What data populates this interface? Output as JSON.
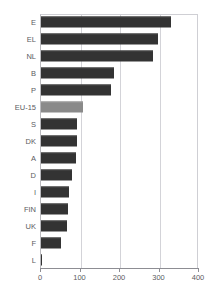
{
  "chart_data": {
    "type": "bar",
    "orientation": "horizontal",
    "title": "",
    "xlabel": "",
    "ylabel": "",
    "xlim": [
      0,
      400
    ],
    "xticks": [
      "0",
      "100",
      "200",
      "300",
      "400"
    ],
    "xtick_values": [
      0,
      100,
      200,
      300,
      400
    ],
    "grid": true,
    "grid_axis": "x",
    "legend": "none",
    "categories": [
      "E",
      "EL",
      "NL",
      "B",
      "P",
      "EU-15",
      "S",
      "DK",
      "A",
      "D",
      "I",
      "FIN",
      "UK",
      "F",
      "L"
    ],
    "values": [
      330,
      296,
      283,
      185,
      177,
      106,
      91,
      91,
      89,
      79,
      71,
      68,
      66,
      51,
      3
    ],
    "highlight_category": "EU-15",
    "colors": {
      "bar": "#333333",
      "bar_highlight": "#8a8a8a",
      "grid": "#d3d3d8",
      "axis": "#8d8d93",
      "text": "#5b5b61",
      "background": "#ffffff"
    }
  }
}
